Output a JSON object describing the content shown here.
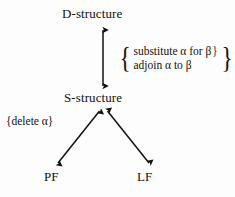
{
  "diagram": {
    "background_color": "#fdfdfd",
    "ink_color": "#111111",
    "nodes": [
      {
        "id": "d-structure",
        "label": "D-structure",
        "x": 103,
        "y": 14
      },
      {
        "id": "s-structure",
        "label": "S-structure",
        "x": 103,
        "y": 97
      },
      {
        "id": "pf",
        "label": "PF",
        "x": 54,
        "y": 176
      },
      {
        "id": "lf",
        "label": "LF",
        "x": 147,
        "y": 176
      }
    ],
    "edges": [
      {
        "id": "d-to-s",
        "from": "d-structure",
        "to": "s-structure",
        "arrowheads": "both",
        "x1": 103,
        "y1": 29,
        "x2": 103,
        "y2": 87
      },
      {
        "id": "s-to-pf",
        "from": "s-structure",
        "to": "pf",
        "arrowheads": "both",
        "x1": 99,
        "y1": 110,
        "x2": 57,
        "y2": 164
      },
      {
        "id": "s-to-lf",
        "from": "s-structure",
        "to": "lf",
        "arrowheads": "both",
        "x1": 108,
        "y1": 110,
        "x2": 150,
        "y2": 164
      }
    ],
    "annotations": {
      "movement": {
        "id": "movement-rules",
        "brace_left": "{",
        "brace_right": "}",
        "lines": [
          {
            "text": "substitute α for β",
            "trailing_brace": "}"
          },
          {
            "text": "adjoin α to β",
            "trailing_brace": ""
          }
        ]
      },
      "deletion": {
        "id": "deletion-rule",
        "text": "{delete α}"
      }
    }
  }
}
